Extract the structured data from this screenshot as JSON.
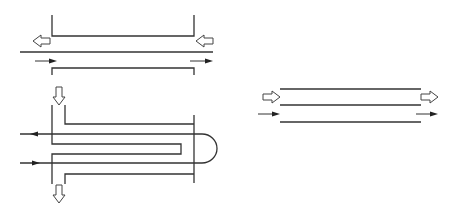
{
  "diagram": {
    "title": "",
    "colors": {
      "line": "#333333",
      "background": "#ffffff",
      "arrow_fill": "#ffffff",
      "small_arrow": "#222222"
    },
    "legend": {
      "hollow-arrow": "shell-side / outer fluid flow",
      "solid-arrow": "tube-side / inner fluid flow"
    },
    "panels": [
      {
        "id": "counter-flow",
        "label": "",
        "outer_flow": "right-to-left",
        "inner_flow": "left-to-right"
      },
      {
        "id": "u-tube",
        "label": "",
        "outer_flow": "top-inlet-bottom-outlet",
        "inner_flow": "in-bottom-out-top via U-bend"
      },
      {
        "id": "parallel-flow",
        "label": "",
        "outer_flow": "left-to-right",
        "inner_flow": "left-to-right"
      }
    ]
  }
}
